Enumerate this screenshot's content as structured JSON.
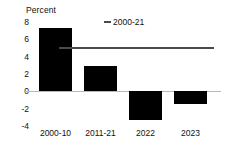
{
  "chart_data": {
    "type": "bar",
    "title": "",
    "xlabel": "",
    "ylabel": "Percent",
    "categories": [
      "2000-10",
      "2011-21",
      "2022",
      "2023"
    ],
    "values": [
      7.3,
      2.9,
      -3.3,
      -1.5
    ],
    "yticks": [
      8,
      6,
      4,
      2,
      0,
      -2,
      -4
    ],
    "ylim": [
      -4,
      8
    ],
    "grid": false,
    "legend_position": "top-center",
    "series": [
      {
        "name": "bars",
        "type": "bar",
        "values": [
          7.3,
          2.9,
          -3.3,
          -1.5
        ]
      },
      {
        "name": "2000-21",
        "type": "hline",
        "value": 5.1
      }
    ],
    "annotations": [
      {
        "name": "reference-line-label",
        "text": "2000-21",
        "value": 5.1
      }
    ],
    "colors": {
      "bar": "#000000",
      "reference_line": "#4a4a4a",
      "zero_axis": "#b9b9b9"
    }
  },
  "legend": {
    "label": "2000-21"
  }
}
